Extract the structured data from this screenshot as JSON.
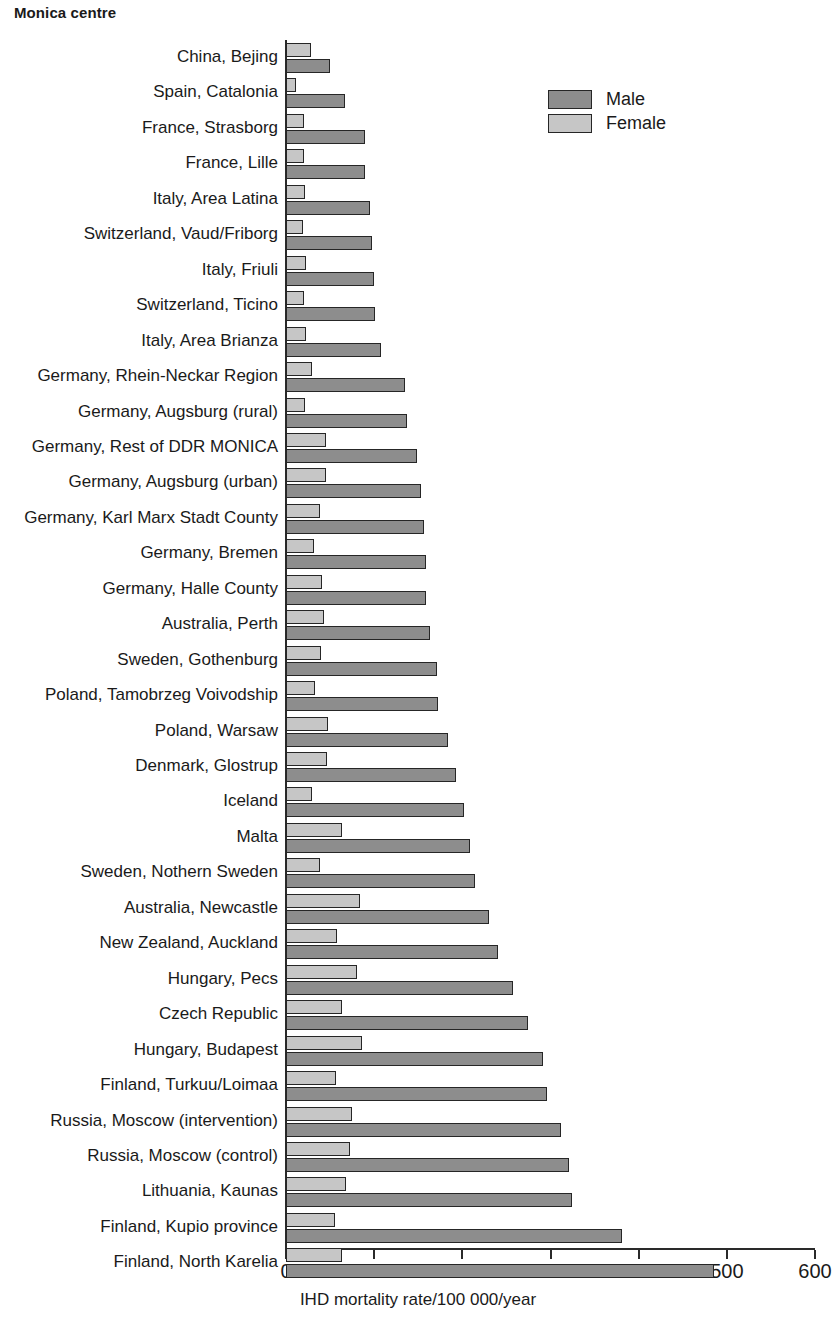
{
  "chart_data": {
    "type": "bar",
    "orientation": "horizontal",
    "title": "Monica centre",
    "xlabel": "IHD mortality rate/100 000/year",
    "ylabel": "",
    "xlim": [
      0,
      600
    ],
    "xticks": [
      0,
      100,
      200,
      300,
      400,
      500,
      600
    ],
    "grid": false,
    "legend_position": "top-right",
    "colors": {
      "male": "#8d8d8d",
      "female": "#c6c6c6",
      "outline": "#262626"
    },
    "categories": [
      "China, Bejing",
      "Spain, Catalonia",
      "France, Strasborg",
      "France, Lille",
      "Italy, Area Latina",
      "Switzerland, Vaud/Friborg",
      "Italy, Friuli",
      "Switzerland, Ticino",
      "Italy, Area Brianza",
      "Germany, Rhein-Neckar Region",
      "Germany, Augsburg (rural)",
      "Germany, Rest of DDR MONICA",
      "Germany, Augsburg (urban)",
      "Germany, Karl Marx Stadt County",
      "Germany, Bremen",
      "Germany, Halle County",
      "Australia, Perth",
      "Sweden, Gothenburg",
      "Poland, Tamobrzeg Voivodship",
      "Poland, Warsaw",
      "Denmark, Glostrup",
      "Iceland",
      "Malta",
      "Sweden, Nothern Sweden",
      "Australia, Newcastle",
      "New Zealand, Auckland",
      "Hungary, Pecs",
      "Czech Republic",
      "Hungary, Budapest",
      "Finland, Turkuu/Loimaa",
      "Russia, Moscow (intervention)",
      "Russia, Moscow (control)",
      "Lithuania, Kaunas",
      "Finland, Kupio province",
      "Finland, North Karelia"
    ],
    "series": [
      {
        "name": "Female",
        "values": [
          28,
          11,
          20,
          20,
          21,
          19,
          23,
          20,
          23,
          29,
          22,
          45,
          45,
          39,
          32,
          41,
          43,
          40,
          33,
          48,
          47,
          29,
          64,
          39,
          84,
          58,
          80,
          64,
          86,
          57,
          75,
          73,
          68,
          56,
          64
        ]
      },
      {
        "name": "Male",
        "values": [
          50,
          67,
          90,
          90,
          95,
          98,
          100,
          101,
          108,
          135,
          137,
          149,
          153,
          156,
          159,
          159,
          163,
          171,
          172,
          184,
          193,
          202,
          209,
          214,
          230,
          240,
          257,
          274,
          291,
          296,
          312,
          321,
          324,
          381,
          486
        ]
      }
    ]
  },
  "legend": {
    "items": [
      {
        "label": "Male",
        "key": "male"
      },
      {
        "label": "Female",
        "key": "female"
      }
    ]
  }
}
